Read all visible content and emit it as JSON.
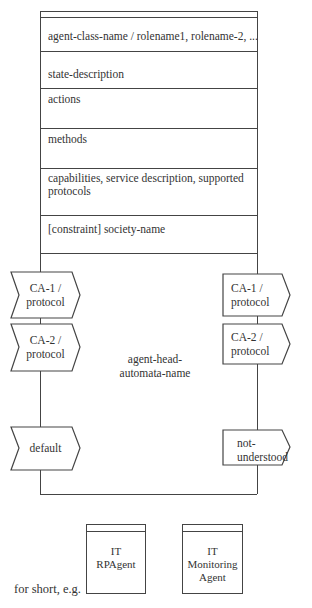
{
  "agent_class": {
    "rows": [
      {
        "label": "agent-class-name / rolename1, rolename-2, ..."
      },
      {
        "label": "state-description"
      },
      {
        "label": "actions"
      },
      {
        "label": "methods"
      },
      {
        "label": "capabilities, service description, supported protocols"
      },
      {
        "label": "[constraint] society-name"
      }
    ]
  },
  "agent_head": {
    "name_line1": "agent-head-",
    "name_line2": "automata-name",
    "incoming": [
      {
        "line1": "CA-1 /",
        "line2": "protocol"
      },
      {
        "line1": "CA-2 /",
        "line2": "protocol"
      },
      {
        "line1": "default",
        "line2": ""
      }
    ],
    "outgoing": [
      {
        "line1": "CA-1 /",
        "line2": "protocol"
      },
      {
        "line1": "CA-2 /",
        "line2": "protocol"
      },
      {
        "line1": "not-",
        "line2": "understood"
      }
    ]
  },
  "short_form": {
    "caption": "for short, e.g.",
    "examples": [
      {
        "line1": "IT",
        "line2": "RPAgent",
        "line3": ""
      },
      {
        "line1": "IT",
        "line2": "Monitoring",
        "line3": "Agent"
      }
    ]
  },
  "colors": {
    "stroke": "#444444",
    "text": "#333333",
    "background": "#ffffff"
  }
}
